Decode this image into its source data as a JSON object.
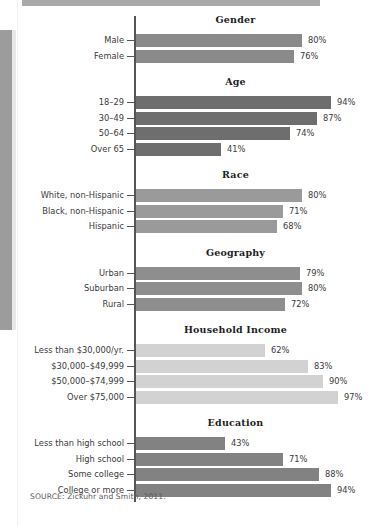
{
  "decor": {
    "top_rule_color": "#a9a9a9",
    "edge_strip_color": "#9c9c9c",
    "axis_color": "#555555"
  },
  "source": {
    "text": "SOURCE: Zickuhr and Smith, 2011."
  },
  "chart_data": {
    "type": "bar",
    "orientation": "horizontal",
    "title": "",
    "xlabel": "",
    "ylabel": "",
    "xlim": [
      0,
      100
    ],
    "value_suffix": "%",
    "grid": false,
    "legend": "none",
    "groups": [
      {
        "name": "Gender",
        "bar_color": "#8a8a8a",
        "categories": [
          "Male",
          "Female"
        ],
        "values": [
          80,
          76
        ],
        "labels": [
          "80%",
          "76%"
        ]
      },
      {
        "name": "Age",
        "bar_color": "#6e6e6e",
        "categories": [
          "18–29",
          "30–49",
          "50–64",
          "Over 65"
        ],
        "values": [
          94,
          87,
          74,
          41
        ],
        "labels": [
          "94%",
          "87%",
          "74%",
          "41%"
        ]
      },
      {
        "name": "Race",
        "bar_color": "#9a9a9a",
        "categories": [
          "White, non-Hispanic",
          "Black, non-Hispanic",
          "Hispanic"
        ],
        "values": [
          80,
          71,
          68
        ],
        "labels": [
          "80%",
          "71%",
          "68%"
        ]
      },
      {
        "name": "Geography",
        "bar_color": "#8e8e8e",
        "categories": [
          "Urban",
          "Suburban",
          "Rural"
        ],
        "values": [
          79,
          80,
          72
        ],
        "labels": [
          "79%",
          "80%",
          "72%"
        ]
      },
      {
        "name": "Household Income",
        "bar_color": "#d2d2d2",
        "categories": [
          "Less than $30,000/yr.",
          "$30,000–$49,999",
          "$50,000–$74,999",
          "Over $75,000"
        ],
        "values": [
          62,
          83,
          90,
          97
        ],
        "labels": [
          "62%",
          "83%",
          "90%",
          "97%"
        ]
      },
      {
        "name": "Education",
        "bar_color": "#828282",
        "categories": [
          "Less than high school",
          "High school",
          "Some college",
          "College or more"
        ],
        "values": [
          43,
          71,
          88,
          94
        ],
        "labels": [
          "43%",
          "71%",
          "88%",
          "94%"
        ]
      }
    ]
  }
}
